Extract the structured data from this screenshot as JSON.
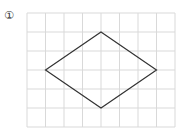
{
  "problem": {
    "number_label": "①"
  },
  "grid": {
    "columns": 8,
    "rows": 6,
    "line_color": "#d9d9d9"
  },
  "shape": {
    "type": "rhombus",
    "stroke_color": "#333333",
    "vertices_grid": [
      [
        4,
        1
      ],
      [
        7,
        3
      ],
      [
        4,
        5
      ],
      [
        1,
        3
      ]
    ]
  }
}
